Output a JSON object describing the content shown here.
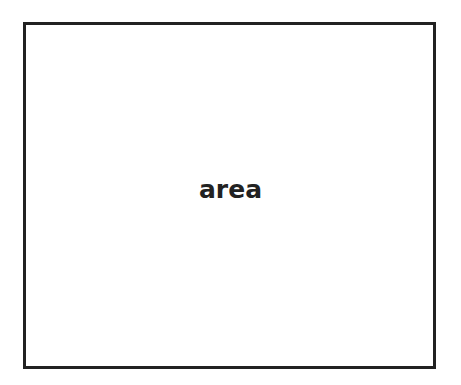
{
  "diagram": {
    "box": {
      "label": "area",
      "border_color": "#222222",
      "fill_color": "#ffffff"
    }
  }
}
